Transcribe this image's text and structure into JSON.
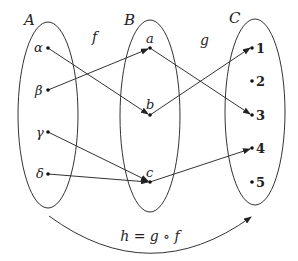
{
  "diagram": {
    "type": "function-composition-mapping",
    "sets": [
      {
        "id": "A",
        "label": "A",
        "elements": [
          "α",
          "β",
          "γ",
          "δ"
        ]
      },
      {
        "id": "B",
        "label": "B",
        "elements": [
          "a",
          "b",
          "c"
        ]
      },
      {
        "id": "C",
        "label": "C",
        "elements": [
          "1",
          "2",
          "3",
          "4",
          "5"
        ]
      }
    ],
    "maps": {
      "f": {
        "label": "f",
        "from": "A",
        "to": "B",
        "pairs": [
          [
            "α",
            "b"
          ],
          [
            "β",
            "a"
          ],
          [
            "γ",
            "c"
          ],
          [
            "δ",
            "c"
          ]
        ]
      },
      "g": {
        "label": "g",
        "from": "B",
        "to": "C",
        "pairs": [
          [
            "a",
            "3"
          ],
          [
            "b",
            "1"
          ],
          [
            "c",
            "4"
          ]
        ]
      }
    },
    "composition_label": "h = g ∘ f",
    "colors": {
      "stroke": "#333333",
      "text": "#222222",
      "background": "#ffffff"
    }
  }
}
